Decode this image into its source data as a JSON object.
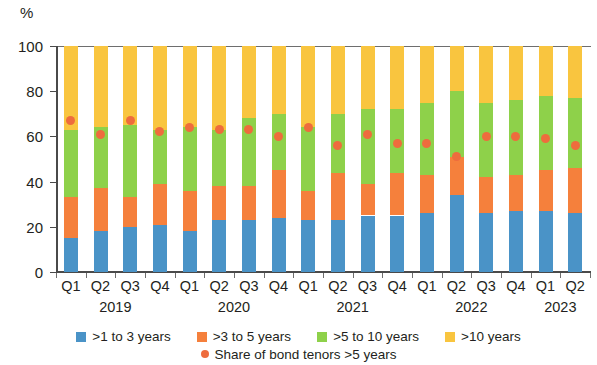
{
  "axis": {
    "unit_label": "%",
    "y_ticks": [
      0,
      20,
      40,
      60,
      80,
      100
    ],
    "y_tick_labels": [
      "0",
      "20",
      "40",
      "60",
      "80",
      "100"
    ]
  },
  "legend": {
    "items": [
      {
        "label": ">1 to 3 years",
        "color": "#4a93c7",
        "marker": "square"
      },
      {
        "label": ">3 to 5 years",
        "color": "#f5803c",
        "marker": "square"
      },
      {
        "label": ">5 to 10 years",
        "color": "#8ed14a",
        "marker": "square"
      },
      {
        "label": ">10 years",
        "color": "#f9c53f",
        "marker": "square"
      }
    ],
    "items_row2": [
      {
        "label": "Share of bond tenors >5 years",
        "color": "#ee6c3d",
        "marker": "circle"
      }
    ]
  },
  "chart_data": {
    "type": "bar",
    "stacked": true,
    "title": "",
    "xlabel": "",
    "ylabel": "%",
    "ylim": [
      0,
      100
    ],
    "grid": false,
    "legend_position": "bottom",
    "categories": [
      "Q1 2019",
      "Q2 2019",
      "Q3 2019",
      "Q4 2019",
      "Q1 2020",
      "Q2 2020",
      "Q3 2020",
      "Q4 2020",
      "Q1 2021",
      "Q2 2021",
      "Q3 2021",
      "Q4 2021",
      "Q1 2022",
      "Q2 2022",
      "Q3 2022",
      "Q4 2022",
      "Q1 2023",
      "Q2 2023"
    ],
    "quarter_labels": [
      "Q1",
      "Q2",
      "Q3",
      "Q4",
      "Q1",
      "Q2",
      "Q3",
      "Q4",
      "Q1",
      "Q2",
      "Q3",
      "Q4",
      "Q1",
      "Q2",
      "Q3",
      "Q4",
      "Q1",
      "Q2"
    ],
    "year_groups": [
      {
        "year": "2019",
        "start_index": 0,
        "count": 4
      },
      {
        "year": "2020",
        "start_index": 4,
        "count": 4
      },
      {
        "year": "2021",
        "start_index": 8,
        "count": 4
      },
      {
        "year": "2022",
        "start_index": 12,
        "count": 4
      },
      {
        "year": "2023",
        "start_index": 16,
        "count": 2
      }
    ],
    "series": [
      {
        "name": ">1 to 3 years",
        "color": "#4a93c7",
        "values": [
          15,
          18,
          20,
          21,
          18,
          23,
          23,
          24,
          23,
          23,
          25,
          25,
          26,
          34,
          26,
          27,
          27,
          26
        ]
      },
      {
        "name": ">3 to 5 years",
        "color": "#f5803c",
        "values": [
          18,
          19,
          13,
          18,
          18,
          15,
          15,
          21,
          13,
          21,
          14,
          19,
          17,
          17,
          16,
          16,
          18,
          20
        ]
      },
      {
        "name": ">5 to 10 years",
        "color": "#8ed14a",
        "values": [
          30,
          27,
          32,
          24,
          28,
          25,
          30,
          25,
          28,
          26,
          33,
          28,
          32,
          29,
          33,
          33,
          33,
          31
        ]
      },
      {
        "name": ">10 years",
        "color": "#f9c53f",
        "values": [
          37,
          36,
          35,
          37,
          36,
          37,
          32,
          30,
          36,
          30,
          28,
          28,
          25,
          20,
          25,
          24,
          22,
          23
        ]
      }
    ],
    "overlay_series": {
      "name": "Share of bond tenors >5 years",
      "color": "#ee6c3d",
      "marker": "circle",
      "values": [
        67,
        61,
        67,
        62,
        64,
        63,
        63,
        60,
        64,
        56,
        61,
        57,
        57,
        51,
        60,
        60,
        59,
        56
      ]
    }
  }
}
